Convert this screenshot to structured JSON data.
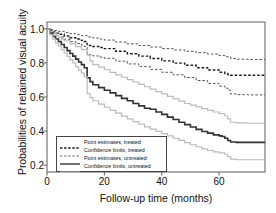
{
  "chart_data": {
    "type": "line",
    "title": "",
    "xlabel": "Follow-up time (months)",
    "ylabel": "Probabilities of retained visual acuity",
    "xlim": [
      0,
      76
    ],
    "ylim": [
      0.16,
      1.04
    ],
    "xticks": [
      0,
      20,
      40,
      60
    ],
    "yticks": [
      1.0,
      0.8,
      0.6,
      0.4,
      0.2
    ],
    "ytick_labels": [
      "1.0",
      "0.8",
      "0.6",
      "0.4",
      "0.2"
    ],
    "xtick_labels": [
      "0",
      "20",
      "40",
      "60"
    ],
    "grid": false,
    "legend_position": "lower left",
    "series": [
      {
        "name": "Confidence limits, treated (upper)",
        "style": "dashed",
        "color": "#555555",
        "width": 1.0,
        "x": [
          0,
          1,
          2,
          4,
          6,
          8,
          10,
          12,
          14,
          16,
          18,
          20,
          24,
          28,
          32,
          36,
          40,
          44,
          48,
          52,
          56,
          60,
          62,
          64,
          66,
          70,
          74,
          76
        ],
        "y": [
          1.0,
          0.995,
          0.99,
          0.985,
          0.978,
          0.972,
          0.966,
          0.96,
          0.952,
          0.946,
          0.94,
          0.934,
          0.922,
          0.912,
          0.902,
          0.893,
          0.884,
          0.876,
          0.868,
          0.86,
          0.852,
          0.843,
          0.836,
          0.826,
          0.822,
          0.82,
          0.82,
          0.82
        ]
      },
      {
        "name": "Point estimates, treated",
        "style": "dashed",
        "color": "#1a1a1a",
        "width": 1.4,
        "x": [
          0,
          1,
          2,
          3,
          4,
          6,
          8,
          10,
          12,
          13,
          14,
          16,
          18,
          20,
          24,
          28,
          32,
          36,
          40,
          44,
          48,
          52,
          56,
          60,
          62,
          63,
          64,
          66,
          70,
          74,
          76
        ],
        "y": [
          1.0,
          0.99,
          0.982,
          0.975,
          0.968,
          0.958,
          0.948,
          0.94,
          0.932,
          0.926,
          0.902,
          0.896,
          0.89,
          0.884,
          0.868,
          0.854,
          0.84,
          0.826,
          0.812,
          0.799,
          0.786,
          0.772,
          0.758,
          0.745,
          0.738,
          0.732,
          0.728,
          0.728,
          0.728,
          0.728,
          0.728
        ]
      },
      {
        "name": "Confidence limits, treated (lower)",
        "style": "dashed",
        "color": "#555555",
        "width": 1.0,
        "x": [
          0,
          1,
          2,
          3,
          4,
          6,
          8,
          10,
          12,
          13,
          14,
          16,
          18,
          20,
          24,
          28,
          32,
          36,
          40,
          44,
          48,
          52,
          56,
          60,
          62,
          63,
          64,
          66,
          70,
          74,
          76
        ],
        "y": [
          1.0,
          0.985,
          0.972,
          0.962,
          0.952,
          0.938,
          0.925,
          0.914,
          0.904,
          0.896,
          0.848,
          0.841,
          0.834,
          0.827,
          0.81,
          0.794,
          0.778,
          0.762,
          0.745,
          0.73,
          0.714,
          0.697,
          0.68,
          0.664,
          0.652,
          0.64,
          0.618,
          0.614,
          0.612,
          0.612,
          0.612
        ]
      },
      {
        "name": "Confidence limits, untreated (upper)",
        "style": "solid",
        "color": "#bbbbbb",
        "width": 1.2,
        "x": [
          0,
          1,
          2,
          3,
          4,
          5,
          6,
          8,
          10,
          12,
          14,
          15,
          16,
          18,
          20,
          22,
          24,
          26,
          28,
          30,
          32,
          34,
          36,
          38,
          40,
          42,
          44,
          46,
          48,
          50,
          52,
          54,
          56,
          58,
          60,
          62,
          63,
          64,
          66,
          70,
          74,
          76
        ],
        "y": [
          1.0,
          0.985,
          0.972,
          0.962,
          0.95,
          0.94,
          0.93,
          0.912,
          0.895,
          0.878,
          0.845,
          0.812,
          0.79,
          0.775,
          0.76,
          0.745,
          0.73,
          0.716,
          0.702,
          0.688,
          0.674,
          0.66,
          0.646,
          0.632,
          0.618,
          0.604,
          0.59,
          0.576,
          0.562,
          0.552,
          0.542,
          0.532,
          0.522,
          0.512,
          0.502,
          0.49,
          0.472,
          0.452,
          0.448,
          0.446,
          0.446,
          0.446
        ]
      },
      {
        "name": "Point estimates, untreated",
        "style": "solid",
        "color": "#333333",
        "width": 1.6,
        "x": [
          0,
          1,
          2,
          3,
          4,
          5,
          6,
          7,
          8,
          9,
          10,
          11,
          12,
          13,
          14,
          15,
          16,
          18,
          20,
          22,
          24,
          26,
          28,
          30,
          32,
          34,
          36,
          38,
          40,
          42,
          44,
          46,
          48,
          50,
          52,
          54,
          56,
          58,
          60,
          61,
          62,
          63,
          64,
          66,
          70,
          74,
          76
        ],
        "y": [
          1.0,
          0.975,
          0.955,
          0.94,
          0.925,
          0.908,
          0.89,
          0.872,
          0.855,
          0.84,
          0.822,
          0.805,
          0.79,
          0.772,
          0.712,
          0.69,
          0.672,
          0.655,
          0.64,
          0.624,
          0.608,
          0.592,
          0.578,
          0.562,
          0.548,
          0.534,
          0.528,
          0.512,
          0.498,
          0.482,
          0.468,
          0.452,
          0.438,
          0.424,
          0.41,
          0.398,
          0.388,
          0.378,
          0.372,
          0.368,
          0.358,
          0.345,
          0.336,
          0.334,
          0.334,
          0.334,
          0.334
        ]
      },
      {
        "name": "Confidence limits, untreated (lower)",
        "style": "solid",
        "color": "#bbbbbb",
        "width": 1.2,
        "x": [
          0,
          1,
          2,
          3,
          4,
          5,
          6,
          7,
          8,
          9,
          10,
          11,
          12,
          13,
          14,
          15,
          16,
          18,
          20,
          22,
          24,
          26,
          28,
          30,
          32,
          34,
          36,
          38,
          40,
          42,
          44,
          46,
          48,
          50,
          52,
          54,
          56,
          58,
          60,
          62,
          63,
          64,
          66,
          70,
          74,
          76
        ],
        "y": [
          1.0,
          0.965,
          0.94,
          0.918,
          0.898,
          0.878,
          0.858,
          0.838,
          0.818,
          0.8,
          0.778,
          0.758,
          0.74,
          0.72,
          0.62,
          0.596,
          0.578,
          0.558,
          0.54,
          0.522,
          0.505,
          0.488,
          0.472,
          0.456,
          0.44,
          0.425,
          0.412,
          0.398,
          0.385,
          0.372,
          0.358,
          0.345,
          0.332,
          0.32,
          0.308,
          0.296,
          0.286,
          0.278,
          0.272,
          0.264,
          0.25,
          0.236,
          0.232,
          0.232,
          0.232,
          0.232
        ]
      }
    ],
    "legend": [
      {
        "label": "Point estimates, treated",
        "style": "dashed",
        "color": "#1a1a1a"
      },
      {
        "label": "Confidence limits, treated",
        "style": "dashed",
        "color": "#666666"
      },
      {
        "label": "Point estimates, untreated",
        "style": "solid",
        "color": "#333333"
      },
      {
        "label": "Confidence limits, untreated",
        "style": "solid",
        "color": "#bbbbbb"
      }
    ]
  },
  "colors": {
    "axis": "#6b6b6b",
    "text": "#111111",
    "background": "#ffffff"
  }
}
